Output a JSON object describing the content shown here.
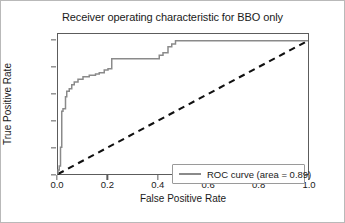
{
  "figure": {
    "title": "Receiver operating characteristic for BBO only",
    "border_color": "#b9b9b9",
    "background": "#ffffff"
  },
  "axis": {
    "xlabel": "False Positive Rate",
    "ylabel": "True Positive Rate",
    "xticks": [
      "0.0",
      "0.2",
      "0.4",
      "0.6",
      "0.8",
      "1.0"
    ],
    "yticks": [
      "0.0",
      "0.2",
      "0.4",
      "0.6",
      "0.8",
      "1.0"
    ],
    "frame_color": "#5c5c5c"
  },
  "legend": {
    "entries": [
      {
        "label": "ROC curve (area = 0.89)",
        "color": "#8a8a8a"
      }
    ]
  },
  "chart_data": {
    "type": "line",
    "title": "Receiver operating characteristic for BBO only",
    "xlabel": "False Positive Rate",
    "ylabel": "True Positive Rate",
    "xlim": [
      0.0,
      1.0
    ],
    "ylim": [
      0.0,
      1.05
    ],
    "grid": false,
    "legend_position": "lower right",
    "annotations": [
      "area = 0.89"
    ],
    "auc": 0.89,
    "series": [
      {
        "name": "ROC curve (area = 0.89)",
        "color": "#8a8a8a",
        "style": "step",
        "linestyle": "solid",
        "x": [
          0.0,
          0.0,
          0.005,
          0.005,
          0.01,
          0.01,
          0.015,
          0.015,
          0.02,
          0.02,
          0.03,
          0.03,
          0.035,
          0.035,
          0.045,
          0.045,
          0.055,
          0.055,
          0.065,
          0.065,
          0.08,
          0.08,
          0.1,
          0.1,
          0.125,
          0.125,
          0.15,
          0.15,
          0.165,
          0.165,
          0.185,
          0.185,
          0.2,
          0.2,
          0.215,
          0.215,
          0.405,
          0.405,
          0.42,
          0.42,
          0.44,
          0.44,
          0.455,
          0.455,
          0.47,
          0.47,
          1.0
        ],
        "y": [
          0.0,
          0.03,
          0.03,
          0.06,
          0.06,
          0.2,
          0.2,
          0.47,
          0.47,
          0.49,
          0.49,
          0.58,
          0.58,
          0.62,
          0.62,
          0.64,
          0.64,
          0.67,
          0.67,
          0.69,
          0.69,
          0.71,
          0.71,
          0.73,
          0.73,
          0.74,
          0.74,
          0.75,
          0.75,
          0.76,
          0.76,
          0.78,
          0.78,
          0.79,
          0.79,
          0.865,
          0.865,
          0.89,
          0.89,
          0.91,
          0.91,
          0.955,
          0.955,
          0.975,
          0.975,
          1.0,
          1.0
        ]
      },
      {
        "name": "chance-diagonal",
        "color": "#111111",
        "style": "line",
        "linestyle": "dashed",
        "x": [
          0.0,
          1.0
        ],
        "y": [
          0.0,
          1.0
        ]
      }
    ]
  }
}
